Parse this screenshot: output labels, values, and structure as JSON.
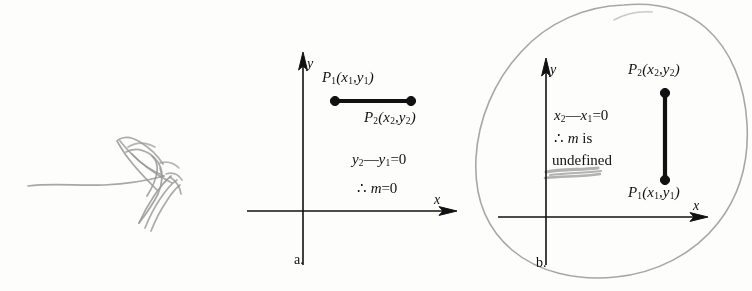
{
  "figure": {
    "cut_header_text": "",
    "background_color": "#fdfdfc",
    "ink_color": "#111111",
    "pencil_color": "#8c8c8c"
  },
  "panel_a": {
    "label": "a.",
    "axis_x_label": "x",
    "axis_y_label": "y",
    "point1_label_prefix": "P",
    "point1_label_sub": "1",
    "point1_coords": "(x",
    "point1_full": "P1(x1,y1)",
    "point2_full": "P2(x2,y2)",
    "statement_line1": "y2—y1=0",
    "statement_line2": "∴ m=0",
    "segment_orientation": "horizontal",
    "segment_endpoints": [
      [
        335,
        101
      ],
      [
        411,
        101
      ]
    ]
  },
  "panel_b": {
    "label": "b.",
    "axis_x_label": "x",
    "axis_y_label": "y",
    "point1_full": "P1(x1,y1)",
    "point2_full": "P2(x2,y2)",
    "statement_line1": "x2—x1=0",
    "statement_line2": "∴ m is",
    "statement_line3": "undefined",
    "segment_orientation": "vertical",
    "segment_endpoints": [
      [
        665,
        93
      ],
      [
        665,
        180
      ]
    ]
  },
  "annotations": {
    "left_scribble_name": "pencil-scribble-arrow",
    "circle_name": "pencil-circle-around-panel-b",
    "strikeout_name": "pencil-strikeout-mark",
    "pencil_color": "#8c8c8c"
  }
}
